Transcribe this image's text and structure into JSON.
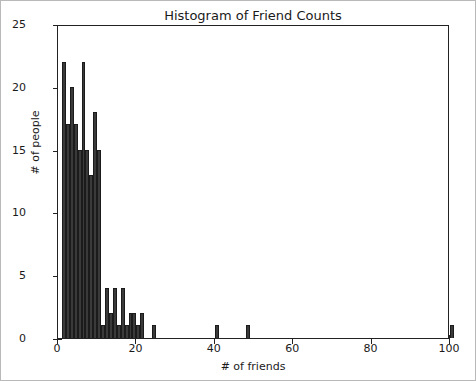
{
  "chart_data": {
    "type": "bar",
    "title": "Histogram of Friend Counts",
    "xlabel": "# of friends",
    "ylabel": "# of people",
    "xlim": [
      0,
      100
    ],
    "ylim": [
      0,
      25
    ],
    "xticks": [
      0,
      20,
      40,
      60,
      80,
      100
    ],
    "yticks": [
      0,
      5,
      10,
      15,
      20,
      25
    ],
    "grid": false,
    "legend": null,
    "bar_color": "#3a3a3a",
    "bar_edge_color": "#1b1b1b",
    "bin_width": 1,
    "categories": [
      1,
      2,
      3,
      4,
      5,
      6,
      7,
      8,
      9,
      10,
      11,
      12,
      13,
      14,
      15,
      16,
      17,
      18,
      19,
      20,
      21,
      24,
      40,
      48,
      100
    ],
    "values": [
      22,
      17,
      20,
      17,
      15,
      22,
      15,
      13,
      18,
      15,
      1,
      4,
      2,
      4,
      1,
      4,
      1,
      2,
      2,
      1,
      2,
      1,
      1,
      1,
      1
    ],
    "series": [
      {
        "name": "# of people",
        "points": [
          {
            "x": 1,
            "y": 22
          },
          {
            "x": 2,
            "y": 17
          },
          {
            "x": 3,
            "y": 20
          },
          {
            "x": 4,
            "y": 17
          },
          {
            "x": 5,
            "y": 15
          },
          {
            "x": 6,
            "y": 22
          },
          {
            "x": 7,
            "y": 15
          },
          {
            "x": 8,
            "y": 13
          },
          {
            "x": 9,
            "y": 18
          },
          {
            "x": 10,
            "y": 15
          },
          {
            "x": 11,
            "y": 1
          },
          {
            "x": 12,
            "y": 4
          },
          {
            "x": 13,
            "y": 2
          },
          {
            "x": 14,
            "y": 4
          },
          {
            "x": 15,
            "y": 1
          },
          {
            "x": 16,
            "y": 4
          },
          {
            "x": 17,
            "y": 1
          },
          {
            "x": 18,
            "y": 2
          },
          {
            "x": 19,
            "y": 2
          },
          {
            "x": 20,
            "y": 1
          },
          {
            "x": 21,
            "y": 2
          },
          {
            "x": 24,
            "y": 1
          },
          {
            "x": 40,
            "y": 1
          },
          {
            "x": 48,
            "y": 1
          },
          {
            "x": 100,
            "y": 1
          }
        ]
      }
    ]
  },
  "axis": {
    "ytick_labels": [
      "0",
      "5",
      "10",
      "15",
      "20",
      "25"
    ],
    "xtick_labels": [
      "0",
      "20",
      "40",
      "60",
      "80",
      "100"
    ]
  }
}
